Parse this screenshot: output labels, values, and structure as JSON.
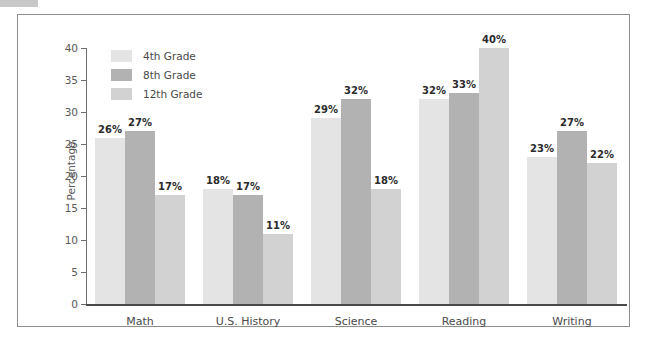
{
  "chart_data": {
    "type": "bar",
    "title": "",
    "xlabel": "",
    "ylabel": "Percentage",
    "ylim": [
      0,
      40
    ],
    "yticks": [
      0,
      5,
      10,
      15,
      20,
      25,
      30,
      35,
      40
    ],
    "grid": false,
    "legend_position": "top-left",
    "categories": [
      "Math",
      "U.S. History",
      "Science",
      "Reading",
      "Writing"
    ],
    "series": [
      {
        "name": "4th Grade",
        "color": "#e4e4e4",
        "values": [
          26,
          18,
          29,
          32,
          23
        ],
        "labels": [
          "26%",
          "18%",
          "29%",
          "32%",
          "23%"
        ]
      },
      {
        "name": "8th Grade",
        "color": "#b2b2b2",
        "values": [
          27,
          17,
          32,
          33,
          27
        ],
        "labels": [
          "27%",
          "17%",
          "32%",
          "33%",
          "27%"
        ]
      },
      {
        "name": "12th Grade",
        "color": "#d2d2d2",
        "values": [
          17,
          11,
          18,
          40,
          22
        ],
        "labels": [
          "17%",
          "11%",
          "18%",
          "40%",
          "22%"
        ]
      }
    ]
  }
}
